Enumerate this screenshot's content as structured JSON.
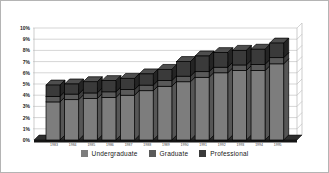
{
  "figure": {
    "background": "#ffffff",
    "border_color": "#b4b4b4"
  },
  "chart_data": {
    "type": "bar",
    "variant": "3d-stacked-column",
    "title": "",
    "xlabel": "",
    "ylabel": "",
    "ylim": [
      0,
      10
    ],
    "grid": true,
    "legend_position": "bottom",
    "y_tick_labels": [
      "10%",
      "9%",
      "8%",
      "7%",
      "6%",
      "5%",
      "4%",
      "3%",
      "2%",
      "1%",
      "0%"
    ],
    "categories": [
      "1983",
      "1984",
      "1985",
      "1986",
      "1987",
      "1988",
      "1989",
      "1990",
      "1991",
      "1992",
      "1993",
      "1994",
      "1995"
    ],
    "series": [
      {
        "name": "Undergraduate",
        "color": "#7d7d7d",
        "side_color": "#565656",
        "top_color": "#8f8f8f",
        "values": [
          3.4,
          3.6,
          3.7,
          3.8,
          4.0,
          4.4,
          4.8,
          5.2,
          5.6,
          6.0,
          6.2,
          6.2,
          6.8
        ]
      },
      {
        "name": "Graduate",
        "color": "#5a5a5a",
        "side_color": "#3e3e3e",
        "top_color": "#6b6b6b",
        "values": [
          0.5,
          0.5,
          0.5,
          0.5,
          0.5,
          0.5,
          0.5,
          0.5,
          0.5,
          0.5,
          0.5,
          0.55,
          0.55
        ]
      },
      {
        "name": "Professional",
        "color": "#3a3a3a",
        "side_color": "#242424",
        "top_color": "#4e4e4e",
        "values": [
          1.0,
          0.9,
          1.0,
          1.0,
          1.0,
          1.0,
          1.0,
          1.3,
          1.4,
          1.3,
          1.3,
          1.35,
          1.3
        ]
      }
    ],
    "totals": [
      4.9,
      5.0,
      5.2,
      5.3,
      5.5,
      5.9,
      6.3,
      7.0,
      7.5,
      7.8,
      8.0,
      8.1,
      8.65
    ],
    "colors": {
      "gridline": "#b8b8b8",
      "axis": "#000000",
      "floor_top": "#2e2e2e",
      "floor_front": "#141414",
      "tick_label": "#222222",
      "year_label": "#3c3c3c"
    }
  }
}
